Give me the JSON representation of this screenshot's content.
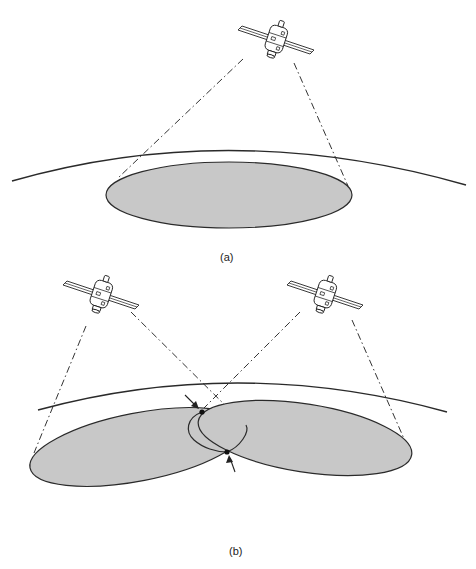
{
  "figure": {
    "panels": [
      {
        "label": "(a)",
        "description": "Single satellite beam footprint on Earth's surface",
        "satellites": 1,
        "footprints": 1
      },
      {
        "label": "(b)",
        "description": "Two satellites with overlapping beam footprints; intersection points marked with arrows",
        "satellites": 2,
        "footprints": 2,
        "intersection_points": 2
      }
    ],
    "icons": [
      "satellite-icon",
      "satellite-icon",
      "satellite-icon"
    ],
    "colors": {
      "footprint_fill": "#c8c8c8",
      "line": "#2a2a2a",
      "background": "#ffffff"
    }
  }
}
